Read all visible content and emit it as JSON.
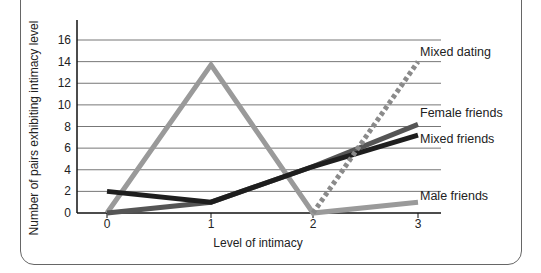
{
  "chart_data": {
    "type": "line",
    "title": "",
    "xlabel": "Level of intimacy",
    "ylabel": "Number of pairs exhibiting intimacy level",
    "x": [
      0,
      1,
      2,
      3
    ],
    "x_ticks": [
      "0",
      "1",
      "2",
      "3"
    ],
    "y_ticks": [
      "0",
      "2",
      "4",
      "6",
      "8",
      "10",
      "12",
      "14",
      "16"
    ],
    "ylim": [
      0,
      16
    ],
    "grid": "horizontal",
    "legend_position": "inline-right",
    "series": [
      {
        "name": "Mixed dating",
        "values": [
          null,
          null,
          0,
          14
        ],
        "color": "#8a8a8a",
        "style": "dotted"
      },
      {
        "name": "Female friends",
        "values": [
          0,
          1,
          4.3,
          8.2
        ],
        "color": "#555555",
        "style": "solid"
      },
      {
        "name": "Mixed friends",
        "values": [
          2,
          1,
          4.3,
          7.2
        ],
        "color": "#1e1e1e",
        "style": "solid"
      },
      {
        "name": "Male friends",
        "values": [
          0,
          13.7,
          0,
          1
        ],
        "color": "#9a9a9a",
        "style": "solid"
      }
    ]
  }
}
